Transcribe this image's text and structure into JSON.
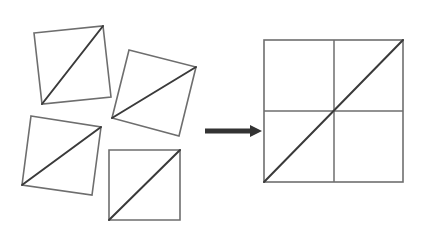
{
  "diagram": {
    "title": "",
    "colors": {
      "background": "#ffffff",
      "edge": "#6e6e6e",
      "diagonal": "#3a3a3a",
      "arrow": "#333333"
    },
    "pieces": [
      {
        "id": "piece-1",
        "points": "34,33 103,26 111,97 42,104",
        "diagonal": [
          42,
          104,
          103,
          26
        ]
      },
      {
        "id": "piece-2",
        "points": "129,50 196,67 179,136 112,118",
        "diagonal": [
          112,
          118,
          196,
          67
        ]
      },
      {
        "id": "piece-3",
        "points": "31,116 101,127 92,195 22,185",
        "diagonal": [
          22,
          185,
          101,
          127
        ]
      },
      {
        "id": "piece-4",
        "points": "109,150 180,150 180,220 109,220",
        "diagonal": [
          109,
          220,
          180,
          150
        ]
      }
    ],
    "arrow": {
      "x1": 205,
      "y1": 131,
      "x2": 251,
      "head": "250,125 262,131 250,137"
    },
    "assembled": {
      "x": 264,
      "y": 40,
      "width": 139,
      "height": 142,
      "mid_x": 334,
      "mid_y": 111,
      "diagonal": [
        264,
        182,
        403,
        40
      ]
    }
  }
}
